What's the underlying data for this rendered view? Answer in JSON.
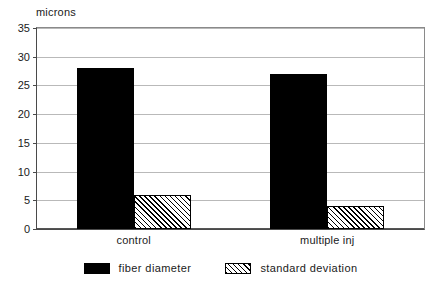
{
  "chart_data": {
    "type": "bar",
    "title": "",
    "subtitle": "",
    "xlabel": "",
    "ylabel": "microns",
    "ylim": [
      0,
      35
    ],
    "ytick_step": 5,
    "yticks": [
      35,
      30,
      25,
      20,
      15,
      10,
      5,
      0
    ],
    "ytick_labels": [
      "35",
      "30",
      "25",
      "20",
      "15",
      "10",
      "5",
      "0"
    ],
    "grid": true,
    "grid_axis": "y",
    "categories": [
      "control",
      "multiple inj"
    ],
    "legend_position": "bottom",
    "series": [
      {
        "name": "fiber diameter",
        "values": [
          28,
          27
        ],
        "fill": "solid",
        "color": "#000000"
      },
      {
        "name": "standard deviation",
        "values": [
          6,
          4
        ],
        "fill": "hatched",
        "color": "#000000"
      }
    ],
    "frame_color": "#4a4a4a",
    "gridline_color": "#b9b9b9",
    "background": "#ffffff"
  }
}
